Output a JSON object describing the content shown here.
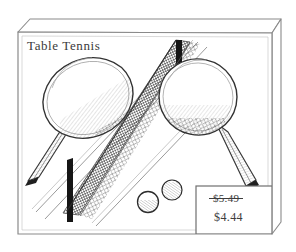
{
  "package": {
    "title": "Table Tennis",
    "pricing": {
      "original_price": "$5.49",
      "sale_price": "$4.44",
      "original_struck_through": true
    }
  },
  "illustration": {
    "subject": "table tennis set",
    "contents": [
      "paddle-left",
      "paddle-right",
      "net",
      "ball",
      "ball"
    ],
    "style": "black-and-white line drawing with cross-hatch shading"
  },
  "colors": {
    "background": "#ffffff",
    "ink": "#3a3a3a",
    "box_outline": "#7a7a7a",
    "net_dark": "#1a1a1a"
  }
}
